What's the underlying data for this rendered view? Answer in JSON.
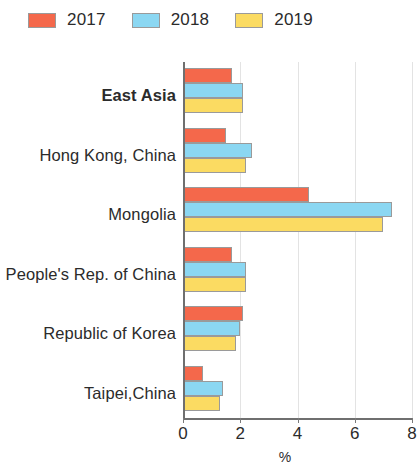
{
  "legend": {
    "entries": [
      {
        "label": "2017",
        "color": "#F4684B"
      },
      {
        "label": "2018",
        "color": "#8BD7F2"
      },
      {
        "label": "2019",
        "color": "#FBDB62"
      }
    ]
  },
  "axis": {
    "x_title": "%",
    "x_ticks": [
      "0",
      "2",
      "4",
      "6",
      "8"
    ]
  },
  "chart_data": {
    "type": "bar",
    "orientation": "horizontal",
    "title": "",
    "xlabel": "%",
    "ylabel": "",
    "xlim": [
      0,
      8
    ],
    "xticks": [
      0,
      2,
      4,
      6,
      8
    ],
    "grid": "vertical-light",
    "legend_position": "top-left",
    "categories": [
      "East Asia",
      "Hong Kong, China",
      "Mongolia",
      "People's Rep. of China",
      "Republic of Korea",
      "Taipei,China"
    ],
    "highlighted_category": "East Asia",
    "series": [
      {
        "name": "2017",
        "color": "#F4684B",
        "values": [
          1.7,
          1.5,
          4.4,
          1.7,
          2.1,
          0.7
        ]
      },
      {
        "name": "2018",
        "color": "#8BD7F2",
        "values": [
          2.1,
          2.4,
          7.3,
          2.2,
          2.0,
          1.4
        ]
      },
      {
        "name": "2019",
        "color": "#FBDB62",
        "values": [
          2.1,
          2.2,
          7.0,
          2.2,
          1.85,
          1.3
        ]
      }
    ]
  }
}
